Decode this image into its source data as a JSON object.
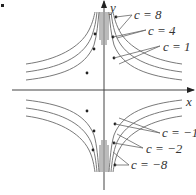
{
  "figure": {
    "axes": {
      "x_label": "x",
      "y_label": "y"
    },
    "labels": [
      {
        "id": "c8",
        "text": "c = 8",
        "c": 8
      },
      {
        "id": "c4",
        "text": "c = 4",
        "c": 4
      },
      {
        "id": "c1",
        "text": "c = 1",
        "c": 1
      },
      {
        "id": "cm1",
        "text": "c = −1",
        "c": -1
      },
      {
        "id": "cm2",
        "text": "c = −2",
        "c": -2
      },
      {
        "id": "cm8",
        "text": "c = −8",
        "c": -8
      }
    ],
    "colors": {
      "curve": "#6a6a6a",
      "axis": "#444444",
      "text": "#333333"
    }
  }
}
